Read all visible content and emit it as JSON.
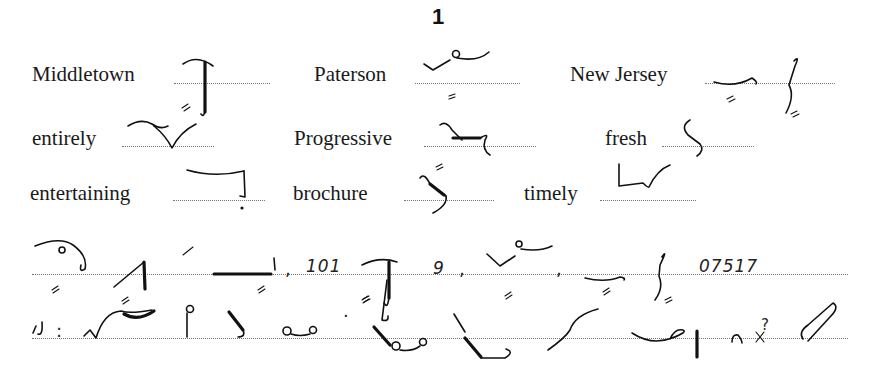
{
  "page": {
    "number": "1"
  },
  "vocabulary": [
    {
      "word": "Middletown"
    },
    {
      "word": "Paterson"
    },
    {
      "word": "New Jersey"
    },
    {
      "word": "entirely"
    },
    {
      "word": "Progressive"
    },
    {
      "word": "fresh"
    },
    {
      "word": "entertaining"
    },
    {
      "word": "brochure"
    },
    {
      "word": "timely"
    }
  ],
  "passage": {
    "line1": {
      "number_101": "101",
      "comma1": ",",
      "numeral_9": "9",
      "comma2": ",",
      "comma3": ",",
      "zip_code": "07517"
    },
    "line2": {
      "colon_mark": ":",
      "period_mark": ".",
      "question_mark": "?"
    }
  },
  "colors": {
    "ink": "#111111",
    "dotted_rule": "#777777",
    "background": "#ffffff"
  }
}
